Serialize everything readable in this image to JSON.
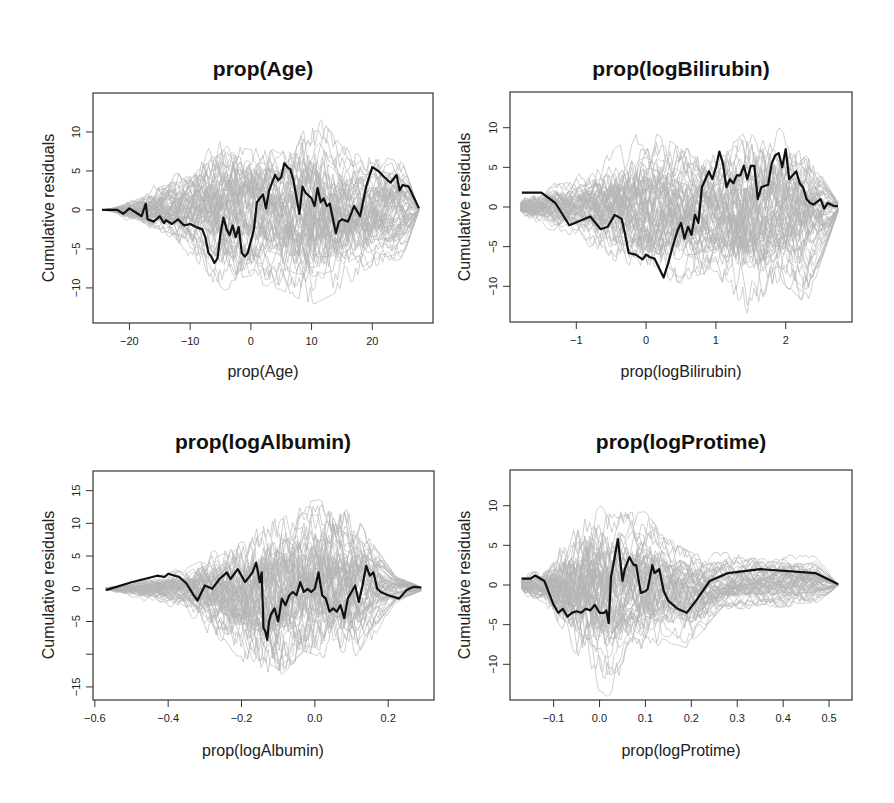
{
  "figure": {
    "background": "#ffffff",
    "colors": {
      "observed": "#111111",
      "simulated": "#b4b4b4",
      "frame": "#333333"
    }
  },
  "chart_data": [
    {
      "type": "line",
      "title": "prop(Age)",
      "xlabel": "prop(Age)",
      "ylabel": "Cumulative residuals",
      "xlim": [
        -26,
        30
      ],
      "ylim": [
        -14.5,
        15
      ],
      "xticks": [
        -20,
        -10,
        0,
        10,
        20
      ],
      "xtick_labels": [
        "-20",
        "-10",
        "0",
        "10",
        "20"
      ],
      "yticks": [
        10,
        5,
        0,
        -5,
        -10
      ],
      "ytick_labels": [
        "10",
        "5",
        "0",
        "-5",
        "-10"
      ],
      "grid": false,
      "legend": null,
      "box": {
        "left": 93,
        "top": 93,
        "right": 433,
        "bottom": 323
      },
      "simulated_envelope": {
        "x": [
          -24.5,
          -20,
          -10,
          -5,
          0,
          5,
          10,
          15,
          20,
          25,
          27.7
        ],
        "upper": [
          0,
          2,
          6,
          10,
          9,
          7,
          13,
          8,
          7,
          6,
          0
        ],
        "lower": [
          0,
          -2,
          -6,
          -10,
          -9,
          -10,
          -12,
          -10,
          -7,
          -6,
          0
        ]
      },
      "series": [
        {
          "name": "observed",
          "x": [
            -24.5,
            -22,
            -21,
            -20,
            -19,
            -18,
            -17.3,
            -17,
            -16,
            -15,
            -14.3,
            -14,
            -13,
            -12,
            -11,
            -10,
            -9,
            -8,
            -7.5,
            -7,
            -6.5,
            -6,
            -5.5,
            -5,
            -4.5,
            -4,
            -3.5,
            -3,
            -2.5,
            -2,
            -1.5,
            -1,
            -0.5,
            0,
            0.5,
            1,
            1.5,
            2,
            2.5,
            3,
            3.5,
            4,
            4.5,
            5,
            5.5,
            6,
            6.5,
            7,
            8,
            8.5,
            9,
            10,
            10.5,
            11,
            11.5,
            12,
            12.5,
            13,
            14,
            14.5,
            15,
            16,
            17,
            18,
            19,
            20,
            21,
            22,
            23,
            24,
            24.5,
            25,
            26,
            27.7
          ],
          "y": [
            0,
            0,
            -0.5,
            0.2,
            -0.3,
            -0.8,
            0.8,
            -1.2,
            -1.5,
            -0.8,
            -1.7,
            -1.3,
            -1.8,
            -1.2,
            -2,
            -1.8,
            -2.2,
            -2.5,
            -3.5,
            -5.5,
            -6,
            -6.8,
            -6.2,
            -3,
            -1,
            -2.5,
            -3.2,
            -2,
            -3.5,
            -2.2,
            -5.5,
            -6,
            -5.5,
            -4,
            -2.5,
            1,
            1.5,
            2,
            0.2,
            2.5,
            3.5,
            4.5,
            3.8,
            4.2,
            6,
            5.5,
            5.2,
            3.8,
            -0.5,
            3,
            2.2,
            1.5,
            0.5,
            2.8,
            1,
            1.5,
            0.5,
            0.8,
            -3,
            -1.5,
            -1.2,
            -1.5,
            0.5,
            -0.8,
            3,
            5.5,
            5,
            4.2,
            3.5,
            4.5,
            2.5,
            3.2,
            3,
            0.2
          ]
        }
      ]
    },
    {
      "type": "line",
      "title": "prop(logBilirubin)",
      "xlabel": "prop(logBilirubin)",
      "ylabel": "Cumulative residuals",
      "xlim": [
        -1.95,
        2.95
      ],
      "ylim": [
        -14.5,
        14.5
      ],
      "xticks": [
        -1,
        0,
        1,
        2
      ],
      "xtick_labels": [
        "-1",
        "0",
        "1",
        "2"
      ],
      "yticks": [
        10,
        5,
        0,
        -5,
        -10
      ],
      "ytick_labels": [
        "10",
        "5",
        "0",
        "-5",
        "-10"
      ],
      "grid": false,
      "legend": null,
      "box": {
        "left": 510,
        "top": 92,
        "right": 852,
        "bottom": 322
      },
      "simulated_envelope": {
        "x": [
          -1.8,
          -1,
          -0.5,
          0,
          0.5,
          1,
          1.4,
          1.9,
          2.3,
          2.75
        ],
        "upper": [
          2.5,
          4,
          7.5,
          10.5,
          8,
          7,
          10.5,
          11,
          7,
          0.5
        ],
        "lower": [
          -2.5,
          -3.5,
          -7,
          -9,
          -10,
          -8,
          -13.5,
          -9,
          -12,
          -0.5
        ]
      },
      "series": [
        {
          "name": "observed",
          "x": [
            -1.78,
            -1.5,
            -1.3,
            -1.1,
            -0.8,
            -0.65,
            -0.55,
            -0.45,
            -0.35,
            -0.3,
            -0.25,
            -0.15,
            -0.05,
            0.0,
            0.05,
            0.12,
            0.25,
            0.32,
            0.38,
            0.45,
            0.5,
            0.55,
            0.6,
            0.65,
            0.7,
            0.75,
            0.8,
            0.85,
            0.9,
            0.95,
            1.0,
            1.05,
            1.1,
            1.15,
            1.2,
            1.25,
            1.3,
            1.35,
            1.4,
            1.45,
            1.5,
            1.55,
            1.6,
            1.65,
            1.75,
            1.8,
            1.85,
            1.9,
            1.95,
            2.0,
            2.05,
            2.1,
            2.15,
            2.2,
            2.25,
            2.3,
            2.35,
            2.4,
            2.5,
            2.55,
            2.6,
            2.7,
            2.75
          ],
          "y": [
            1.8,
            1.8,
            0.5,
            -2.3,
            -1.2,
            -2.8,
            -2.5,
            -1,
            -1.5,
            -3.5,
            -5.8,
            -6,
            -6.6,
            -6,
            -6.3,
            -6.5,
            -8.9,
            -7,
            -5,
            -3,
            -2,
            -4,
            -2.5,
            -3.5,
            -1,
            -2,
            2.5,
            3.5,
            4.5,
            3.5,
            5,
            7,
            5.5,
            2.5,
            3.5,
            3,
            4,
            4,
            5.2,
            3.5,
            5.2,
            5.2,
            1,
            2.5,
            2.8,
            5.5,
            6.5,
            6.8,
            5,
            7.3,
            3.5,
            4,
            4.5,
            3,
            2.5,
            1,
            0.5,
            0.3,
            1,
            -0.2,
            0.5,
            0.1,
            0.1
          ]
        }
      ]
    },
    {
      "type": "line",
      "title": "prop(logAlbumin)",
      "xlabel": "prop(logAlbumin)",
      "ylabel": "Cumulative residuals",
      "xlim": [
        -0.605,
        0.325
      ],
      "ylim": [
        -17,
        18
      ],
      "xticks": [
        -0.6,
        -0.4,
        -0.2,
        0.0,
        0.2
      ],
      "xtick_labels": [
        "-0.6",
        "-0.4",
        "-0.2",
        "0.0",
        "0.2"
      ],
      "yticks": [
        15,
        10,
        5,
        0,
        -5,
        -10,
        -15
      ],
      "ytick_labels": [
        "15",
        "10",
        "5",
        "0",
        "-5",
        "",
        "-15"
      ],
      "grid": false,
      "legend": null,
      "box": {
        "left": 93,
        "top": 471,
        "right": 434,
        "bottom": 700
      },
      "simulated_envelope": {
        "x": [
          -0.57,
          -0.45,
          -0.35,
          -0.25,
          -0.15,
          -0.1,
          -0.03,
          0.02,
          0.1,
          0.15,
          0.22,
          0.29
        ],
        "upper": [
          0.5,
          2.5,
          4,
          8,
          11,
          14,
          14,
          14.5,
          13,
          8,
          2,
          0.3
        ],
        "lower": [
          -0.5,
          -2,
          -4,
          -10,
          -14,
          -16,
          -12,
          -13,
          -14,
          -8,
          -2,
          -0.3
        ]
      },
      "series": [
        {
          "name": "observed",
          "x": [
            -0.57,
            -0.5,
            -0.43,
            -0.41,
            -0.4,
            -0.37,
            -0.35,
            -0.33,
            -0.32,
            -0.3,
            -0.28,
            -0.26,
            -0.24,
            -0.23,
            -0.21,
            -0.19,
            -0.17,
            -0.16,
            -0.15,
            -0.145,
            -0.14,
            -0.135,
            -0.13,
            -0.125,
            -0.12,
            -0.11,
            -0.1,
            -0.09,
            -0.08,
            -0.07,
            -0.06,
            -0.05,
            -0.04,
            -0.03,
            -0.02,
            -0.01,
            0.0,
            0.01,
            0.02,
            0.03,
            0.04,
            0.05,
            0.06,
            0.07,
            0.08,
            0.085,
            0.09,
            0.1,
            0.11,
            0.12,
            0.13,
            0.14,
            0.15,
            0.16,
            0.17,
            0.18,
            0.2,
            0.23,
            0.25,
            0.27,
            0.29
          ],
          "y": [
            -0.2,
            1,
            2,
            1.8,
            2.3,
            1.8,
            0.8,
            -1,
            -1.8,
            0.5,
            0,
            1.5,
            2.5,
            1.5,
            3,
            1,
            2.5,
            4,
            1,
            2.5,
            -6,
            -6.5,
            -7.8,
            -5,
            -4,
            -3,
            -5,
            -1.5,
            -2.5,
            -1,
            -0.5,
            -1,
            1,
            -0.5,
            0,
            -0.5,
            0,
            2.5,
            -1,
            -1.5,
            -3.5,
            -3,
            -3.5,
            -2.5,
            -4.5,
            -3,
            -1.5,
            -0.5,
            0.5,
            -2,
            0.5,
            3.5,
            2,
            2.5,
            0,
            -0.5,
            -1,
            -1.5,
            -0.2,
            0.3,
            0.2
          ]
        }
      ]
    },
    {
      "type": "line",
      "title": "prop(logProtime)",
      "xlabel": "prop(logProtime)",
      "ylabel": "Cumulative residuals",
      "xlim": [
        -0.195,
        0.55
      ],
      "ylim": [
        -14.5,
        14.5
      ],
      "xticks": [
        -0.1,
        0.0,
        0.1,
        0.2,
        0.3,
        0.4,
        0.5
      ],
      "xtick_labels": [
        "-0.1",
        "0.0",
        "0.1",
        "0.2",
        "0.3",
        "0.4",
        "0.5"
      ],
      "yticks": [
        10,
        5,
        0,
        -5,
        -10
      ],
      "ytick_labels": [
        "10",
        "5",
        "0",
        "-5",
        "-10"
      ],
      "grid": false,
      "legend": null,
      "box": {
        "left": 510,
        "top": 470,
        "right": 852,
        "bottom": 700
      },
      "simulated_envelope": {
        "x": [
          -0.17,
          -0.12,
          -0.08,
          -0.03,
          0.02,
          0.07,
          0.1,
          0.14,
          0.2,
          0.27,
          0.47,
          0.52
        ],
        "upper": [
          2.5,
          3,
          8,
          12,
          9,
          9,
          9,
          6,
          4,
          4,
          3.5,
          0
        ],
        "lower": [
          -2.5,
          -3,
          -8,
          -12,
          -14,
          -8,
          -11,
          -7,
          -8,
          -3,
          -2.5,
          0
        ]
      },
      "series": [
        {
          "name": "observed",
          "x": [
            -0.17,
            -0.15,
            -0.14,
            -0.12,
            -0.1,
            -0.09,
            -0.08,
            -0.07,
            -0.06,
            -0.05,
            -0.04,
            -0.03,
            -0.02,
            -0.01,
            0.0,
            0.01,
            0.015,
            0.02,
            0.025,
            0.03,
            0.04,
            0.05,
            0.055,
            0.065,
            0.075,
            0.08,
            0.09,
            0.1,
            0.105,
            0.115,
            0.12,
            0.13,
            0.14,
            0.15,
            0.17,
            0.19,
            0.21,
            0.24,
            0.28,
            0.35,
            0.47,
            0.52
          ],
          "y": [
            0.8,
            0.8,
            1.2,
            0.5,
            -2.5,
            -3.5,
            -3,
            -4,
            -3.5,
            -3.3,
            -3.5,
            -3,
            -3.2,
            -2.5,
            -3.5,
            -3.5,
            -3.2,
            -4.8,
            1,
            2.5,
            5.8,
            0.5,
            2,
            3.5,
            2.5,
            2.5,
            -1,
            -0.8,
            -0.5,
            2.5,
            1.5,
            2,
            -0.8,
            -2,
            -3,
            -3.5,
            -2,
            0.5,
            1.5,
            2,
            1.5,
            0.1
          ]
        }
      ]
    }
  ]
}
